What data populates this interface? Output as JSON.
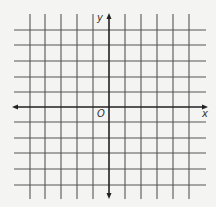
{
  "diagram": {
    "type": "coordinate-grid",
    "labels": {
      "y_axis": "y",
      "x_axis": "x",
      "origin": "O"
    },
    "grid": {
      "vertical_lines_x": [
        30,
        45,
        61,
        77,
        93,
        125,
        141,
        157,
        173,
        189
      ],
      "horizontal_lines_y": [
        30,
        45,
        61,
        77,
        92,
        122,
        138,
        153,
        169,
        185
      ],
      "line_color": "#555555",
      "extent": {
        "x_min": 14,
        "x_max": 206,
        "y_min": 14,
        "y_max": 199
      }
    },
    "axes": {
      "x_axis_y": 107,
      "y_axis_x": 109,
      "color": "#222222",
      "x_range": [
        12,
        208
      ],
      "y_range": [
        13,
        199
      ]
    }
  }
}
